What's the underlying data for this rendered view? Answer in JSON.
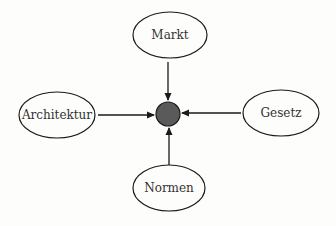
{
  "diagram": {
    "type": "influence-diagram",
    "background": "#fdfdfb",
    "stroke_color": "#1a1a1a",
    "text_color": "#333333",
    "center": {
      "label": "",
      "fill": "#5a5a5a",
      "cx": 168,
      "cy": 114,
      "r": 12
    },
    "nodes": [
      {
        "id": "markt",
        "label": "Markt",
        "cx": 170,
        "cy": 35,
        "rx": 37,
        "ry": 23,
        "position": "top"
      },
      {
        "id": "architektur",
        "label": "Architektur",
        "cx": 57,
        "cy": 115,
        "rx": 38,
        "ry": 23,
        "position": "left"
      },
      {
        "id": "gesetz",
        "label": "Gesetz",
        "cx": 281,
        "cy": 113,
        "rx": 38,
        "ry": 23,
        "position": "right"
      },
      {
        "id": "normen",
        "label": "Normen",
        "cx": 169,
        "cy": 188,
        "rx": 36,
        "ry": 23,
        "position": "bottom"
      }
    ],
    "edges": [
      {
        "from": "markt",
        "to": "center",
        "x1": 168,
        "y1": 62,
        "x2": 168,
        "y2": 100
      },
      {
        "from": "architektur",
        "to": "center",
        "x1": 98,
        "y1": 115,
        "x2": 154,
        "y2": 115
      },
      {
        "from": "gesetz",
        "to": "center",
        "x1": 241,
        "y1": 113,
        "x2": 182,
        "y2": 113
      },
      {
        "from": "normen",
        "to": "center",
        "x1": 169,
        "y1": 165,
        "x2": 169,
        "y2": 128
      }
    ]
  }
}
